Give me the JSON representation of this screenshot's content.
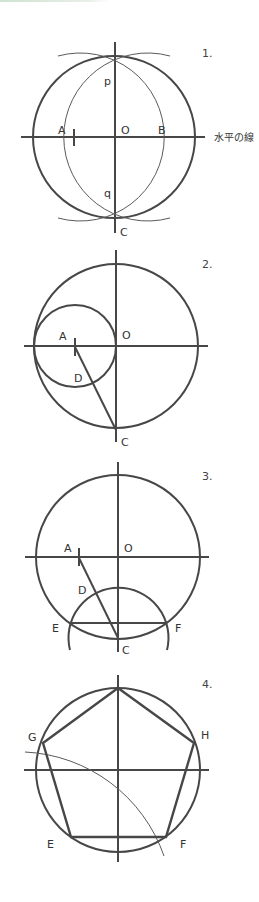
{
  "steps": [
    {
      "number": "1.",
      "labels": {
        "p": "p",
        "q": "q",
        "A": "A",
        "O": "O",
        "B": "B",
        "C": "C"
      },
      "horizontal_line_label": "水平の線",
      "description": "Circle with center O; arcs centered at A and B intersect at p and q, giving the vertical diameter through C."
    },
    {
      "number": "2.",
      "labels": {
        "A": "A",
        "O": "O",
        "D": "D",
        "C": "C"
      },
      "description": "Small circle centered at A (midpoint of radius) through O; line from A to C crosses it at D."
    },
    {
      "number": "3.",
      "labels": {
        "A": "A",
        "O": "O",
        "D": "D",
        "E": "E",
        "F": "F",
        "C": "C"
      },
      "description": "Arc centered at C with radius CD cuts the circle at E and F; EF is one side."
    },
    {
      "number": "4.",
      "labels": {
        "G": "G",
        "H": "H",
        "E": "E",
        "F": "F"
      },
      "description": "Step EF around the circle to find G and H, completing the pentagon."
    }
  ],
  "colors": {
    "line": "#474747",
    "background": "#ffffff"
  }
}
